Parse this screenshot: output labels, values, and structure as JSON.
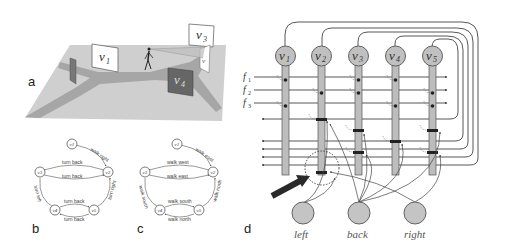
{
  "panels": {
    "a": {
      "label": "a",
      "scene": {
        "views": [
          {
            "id": "v1",
            "text": "v",
            "sub": "1",
            "shade": "white"
          },
          {
            "id": "v2",
            "text": "v",
            "sub": "2",
            "shade": "white"
          },
          {
            "id": "v3",
            "text": "v",
            "sub": "3",
            "shade": "white"
          },
          {
            "id": "v4",
            "text": "v",
            "sub": "4",
            "shade": "dark"
          },
          {
            "id": "v5",
            "text": "v",
            "sub": "5",
            "shade": "dark"
          }
        ],
        "description": "Walker on Y-shaped path with five view panels"
      }
    },
    "b": {
      "label": "b",
      "nodes": [
        "v1",
        "v2",
        "v3",
        "v4",
        "v5"
      ],
      "edges": [
        {
          "from": "v1",
          "to": "v2",
          "label": "walk right"
        },
        {
          "from": "v2",
          "to": "v3",
          "label": "turn back"
        },
        {
          "from": "v3",
          "to": "v2",
          "label": "turn back"
        },
        {
          "from": "v3",
          "to": "v4",
          "label": "turn left"
        },
        {
          "from": "v5",
          "to": "v2",
          "label": "turn right"
        },
        {
          "from": "v4",
          "to": "v5",
          "label": "turn back"
        },
        {
          "from": "v5",
          "to": "v4",
          "label": "turn back"
        }
      ]
    },
    "c": {
      "label": "c",
      "nodes": [
        "v1",
        "v2",
        "v3",
        "v4",
        "v5"
      ],
      "edges": [
        {
          "from": "v1",
          "to": "v2",
          "label": "walk east"
        },
        {
          "from": "v2",
          "to": "v3",
          "label": "walk west"
        },
        {
          "from": "v3",
          "to": "v2",
          "label": "walk east"
        },
        {
          "from": "v3",
          "to": "v4",
          "label": "walk south"
        },
        {
          "from": "v5",
          "to": "v2",
          "label": "walk north"
        },
        {
          "from": "v4",
          "to": "v5",
          "label": "walk south"
        },
        {
          "from": "v5",
          "to": "v4",
          "label": "walk north"
        }
      ]
    },
    "d": {
      "label": "d",
      "neurons": [
        {
          "text": "v",
          "sub": "1"
        },
        {
          "text": "v",
          "sub": "2"
        },
        {
          "text": "v",
          "sub": "3"
        },
        {
          "text": "v",
          "sub": "4"
        },
        {
          "text": "v",
          "sub": "5"
        }
      ],
      "feature_inputs": [
        {
          "text": "f",
          "sub": "1"
        },
        {
          "text": "f",
          "sub": "2"
        },
        {
          "text": "f",
          "sub": "3"
        }
      ],
      "action_inputs": [
        "left",
        "back",
        "right"
      ]
    }
  },
  "colors": {
    "ground": "#c8c8c8",
    "path": "#a0a0a0",
    "neuron_fill": "#c0c0c0",
    "neuron_stroke": "#555555",
    "line": "#444444",
    "arrow": "#222222"
  }
}
